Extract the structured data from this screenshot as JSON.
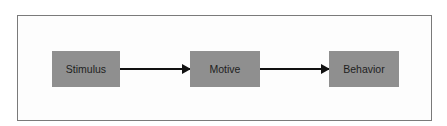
{
  "diagram": {
    "type": "flow",
    "nodes": [
      {
        "id": "stimulus",
        "label": "Stimulus"
      },
      {
        "id": "motive",
        "label": "Motive"
      },
      {
        "id": "behavior",
        "label": "Behavior"
      }
    ],
    "edges": [
      {
        "from": "stimulus",
        "to": "motive"
      },
      {
        "from": "motive",
        "to": "behavior"
      }
    ],
    "colors": {
      "node_fill": "#8f8f8f",
      "text": "#1e1e1e",
      "arrow": "#111111",
      "frame_border": "#7a7a7a"
    }
  }
}
